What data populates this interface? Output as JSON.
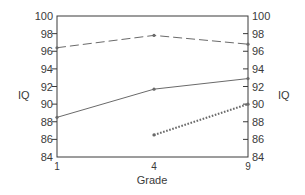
{
  "chart_data": {
    "type": "line",
    "title": "",
    "xlabel": "Grade",
    "ylabel": "IQ",
    "ylabel_right": "IQ",
    "categories": [
      "1",
      "4",
      "9"
    ],
    "ylim": [
      84,
      100
    ],
    "yticks": [
      84,
      86,
      88,
      90,
      92,
      94,
      96,
      98,
      100
    ],
    "grid": false,
    "legend": null,
    "series": [
      {
        "name": "dashed",
        "style": "dashed",
        "values": [
          96.4,
          97.8,
          96.8
        ]
      },
      {
        "name": "solid",
        "style": "solid",
        "values": [
          88.5,
          91.7,
          92.9
        ]
      },
      {
        "name": "dotted",
        "style": "dotted",
        "values": [
          null,
          86.5,
          90.0
        ]
      }
    ]
  },
  "colors": {
    "line": "#6a6a6a",
    "axis": "#3a3a3a",
    "text": "#3a3a3a"
  }
}
